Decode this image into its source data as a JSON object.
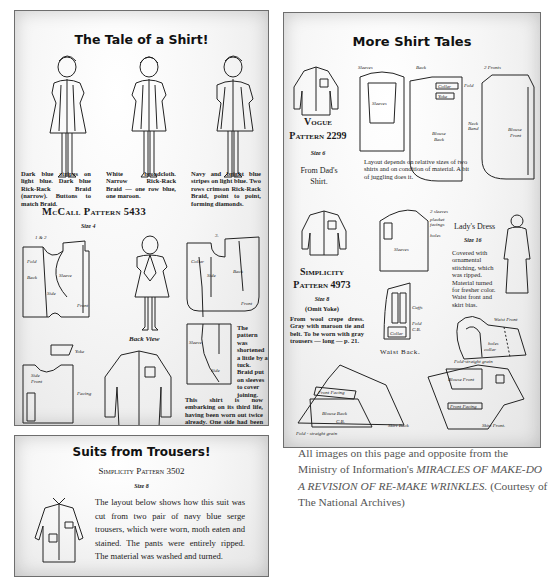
{
  "panel_left_top": {
    "title": "The Tale of a Shirt!",
    "figures": [
      {
        "number": "1.",
        "caption": "Dark blue stripes on light blue. Dark blue Rick-Rack Braid (narrow). Buttons to match Braid."
      },
      {
        "number": "2.",
        "caption": "White broadcloth. Narrow Rick-Rack Braid — one row blue, one maroon."
      },
      {
        "number": "3.",
        "caption": "Navy and bright blue stripes on light blue. Two rows crimson Rick-Rack Braid, point to point, forming diamonds."
      }
    ],
    "pattern_name": "McCall Pattern 5433",
    "size": "Size 4",
    "layout_label_1": "1 & 2",
    "layout_label_2": "3.",
    "piece_labels": [
      "Fold C.B.",
      "Back",
      "Side Back",
      "Sleeve",
      "Front",
      "Collar",
      "Yoke",
      "Side Front",
      "Facing"
    ],
    "back_view_label": "Back View",
    "note_tuck": "The pattern was shortened a little by a tuck. Braid put on sleeves to cover joining.",
    "note_third_life": "This shirt is now embarking on its third life, having been worn out twice already. One side had been raised to remove worn spot at neck."
  },
  "panel_right": {
    "title": "More Shirt Tales",
    "vogue": {
      "pattern_name_line1": "Vogue",
      "pattern_name_line2": "Pattern 2299",
      "size": "Size 6",
      "subtitle": "From Dad's Shirt."
    },
    "layout_note": "Layout depends on relative sizes of two shirts and on condition of material. A bit of juggling does it.",
    "layout_labels": [
      "Sleeves",
      "Back",
      "2 Fronts",
      "Collar",
      "Fold",
      "Yoke",
      "Neck Band",
      "Blouse Back",
      "Blouse Front",
      "wear"
    ],
    "simplicity": {
      "pattern_name_line1": "Simplicity",
      "pattern_name_line2": "Pattern 4973",
      "size": "Size 8",
      "note": "(Omit Yoke)",
      "description": "From wool crepe dress. Gray with maroon tie and belt. To be worn with gray trousers — long — p. 21."
    },
    "ladys_dress": {
      "heading": "Lady's Dress",
      "size": "Size 16",
      "description": "Covered with ornamental stitching, which was ripped. Material turned for fresher color. Waist front and skirt bias."
    },
    "diagram_labels": [
      "2 sleeves",
      "placket facings",
      "holes",
      "Sleeves",
      "Cuffs",
      "Fold C.B.",
      "Collar",
      "Waist Back.",
      "Waist Front",
      "holes",
      "collar",
      "Fold-straight grain",
      "Blouse Front",
      "Front Facing",
      "Skirt Front.",
      "Front Facing",
      "Blouse Back",
      "C.B.",
      "Skirt Back",
      "Fold - straight grain"
    ]
  },
  "panel_left_bottom": {
    "title": "Suits from Trousers!",
    "pattern_name": "Simplicity Pattern 3502",
    "size": "Size 8",
    "description": "The layout below shows how this suit was cut from two pair of navy blue serge trousers, which were worn, moth eaten and stained. The pants were entirely ripped. The material was washed and turned."
  },
  "caption": {
    "prefix": "All images on this page and opposite from the Ministry of Information's ",
    "italic": "MIRACLES OF MAKE-DO A REVISION OF RE-MAKE WRINKLES.",
    "suffix": " (Courtesy of The National Archives)"
  }
}
